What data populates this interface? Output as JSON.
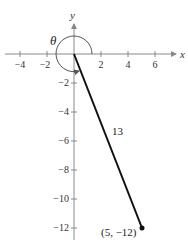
{
  "diagram": {
    "type": "coordinate-plane-angle",
    "axes": {
      "x_label": "x",
      "y_label": "y",
      "x_ticks": [
        "−4",
        "−2",
        "2",
        "4",
        "6"
      ],
      "y_ticks": [
        "−2",
        "−4",
        "−6",
        "−8",
        "−10",
        "−12"
      ]
    },
    "angle": {
      "symbol": "θ",
      "direction": "counterclockwise"
    },
    "segment": {
      "length_label": "13",
      "endpoint_label": "(5, −12)"
    },
    "colors": {
      "axis": "#888888",
      "segment": "#111111",
      "arc": "#555555"
    }
  }
}
